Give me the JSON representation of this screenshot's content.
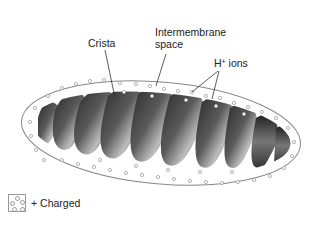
{
  "diagram": {
    "labels": {
      "crista": "Crista",
      "intermembrane_line1": "Intermembrane",
      "intermembrane_line2": "space",
      "h_ions_base": "H",
      "h_ions_sup": "+",
      "h_ions_rest": " ions"
    },
    "legend": {
      "label": "+ Charged"
    },
    "colors": {
      "outline": "#888888",
      "dot": "#a0a0a0",
      "crista_dark": "#2a2a2a",
      "crista_light": "#bdbdbd",
      "text": "#222222"
    }
  }
}
